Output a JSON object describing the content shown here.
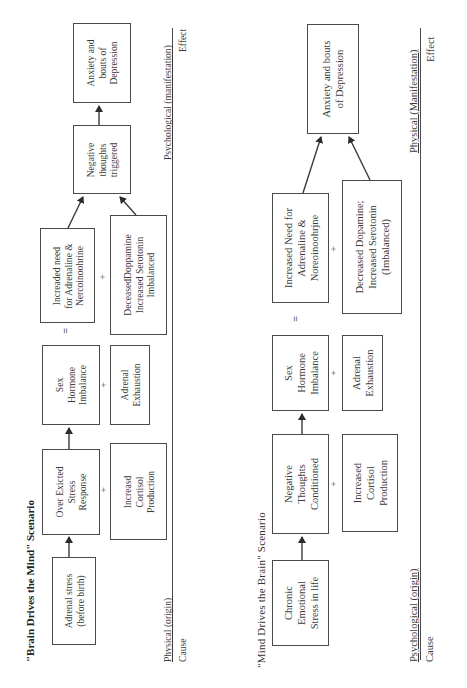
{
  "scenarios": [
    {
      "title": "\"Brain Drives the Mind\" Scenario",
      "origin_label": "Physical (origin)",
      "cause_label": "Cause",
      "manifestation_label": "Psychological (manifestation)",
      "effect_label": "Effect",
      "nodes": {
        "start": [
          "Adrenal stress",
          "(before birth)"
        ],
        "step2": [
          "Over Exicted",
          "Stress",
          "Response"
        ],
        "step2_plus": [
          "Increasd",
          "Cortisol",
          "Production"
        ],
        "step3": [
          "Sex",
          "Hormone",
          "Imbalance"
        ],
        "step3_plus": [
          "Adrenal",
          "Exhaustion"
        ],
        "step4": [
          "Increaded need",
          "for Adrenaline &",
          "Nercoinoohrine"
        ],
        "step4_plus": [
          "DeceasedDoppamine",
          "Increased Serotonin",
          "Imbalanced"
        ],
        "step5": [
          "Negative",
          "thoughts",
          "triggered"
        ],
        "end": [
          "Anxiety and",
          "bouts of",
          "Depression"
        ]
      },
      "operators": {
        "plus": "+",
        "equals": "="
      }
    },
    {
      "title": "\"Mind Drives the Brain\" Scenario",
      "origin_label": "Psychological (origin)",
      "cause_label": "Cause",
      "manifestation_label": "Physical (Manifestation)",
      "effect_label": "Effect",
      "nodes": {
        "start": [
          "Chronic",
          "Emotional",
          "Stress in life"
        ],
        "step2": [
          "Negative",
          "Thoughts",
          "Conditioned"
        ],
        "step2_plus": [
          "Increased",
          "Cortisol",
          "Production"
        ],
        "step3": [
          "Sex",
          "Hormone",
          "Imbalance"
        ],
        "step3_plus": [
          "Adrenal",
          "Exhaustion"
        ],
        "step4": [
          "Increased Need for",
          "Adrenaline &",
          "Noreoinoohrjne"
        ],
        "step4_plus": [
          "Decreased Dopamine;",
          "Increased Serotonin",
          "(Imbalanced)"
        ],
        "end": [
          "Anxiety and bouts",
          "of Depression"
        ]
      },
      "operators": {
        "plus": "+",
        "equals": "="
      }
    }
  ]
}
